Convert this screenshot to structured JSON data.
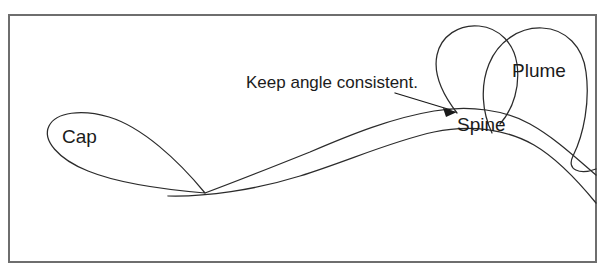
{
  "figure": {
    "background_color": "#ffffff",
    "frame_color": "#6e6e6e",
    "ink_color": "#2b2b2b",
    "text_color": "#1b1b1b"
  },
  "labels": {
    "cap": "Cap",
    "spine": "Spine",
    "plume": "Plume",
    "note": "Keep angle consistent."
  },
  "shapes": {
    "cap_name": "cap-teardrop",
    "spine_name": "spine-ribbon",
    "plume_front_name": "plume-front-teardrop",
    "plume_back_name": "plume-back-teardrop"
  },
  "annotation": {
    "arrow_name": "leader-arrow",
    "points_to": "Spine"
  }
}
